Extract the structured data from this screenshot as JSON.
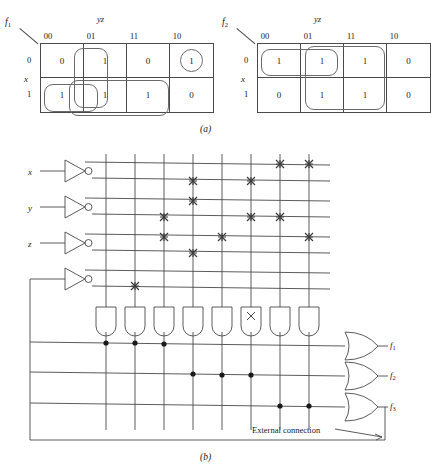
{
  "figure": {
    "part_a_label": "(a)",
    "part_b_label": "(b)"
  },
  "kmaps": [
    {
      "name": "f1",
      "name_base": "f",
      "name_sub": "1",
      "col_var": "yz",
      "row_var": "x",
      "col_headers": [
        "00",
        "01",
        "11",
        "10"
      ],
      "row_headers": [
        "0",
        "1"
      ],
      "values": [
        [
          "0",
          "1",
          "0",
          "1"
        ],
        [
          "1",
          "1",
          "1",
          "0"
        ]
      ],
      "groups": [
        "column-01-pair",
        "row-1-cells-00-01-11",
        "cell-0-10-single"
      ]
    },
    {
      "name": "f2",
      "name_base": "f",
      "name_sub": "2",
      "col_var": "yz",
      "row_var": "x",
      "col_headers": [
        "00",
        "01",
        "11",
        "10"
      ],
      "row_headers": [
        "0",
        "1"
      ],
      "values": [
        [
          "1",
          "1",
          "1",
          "0"
        ],
        [
          "0",
          "1",
          "1",
          "0"
        ]
      ],
      "groups": [
        "row-0-cells-00-01",
        "columns-01-11-both-rows"
      ]
    }
  ],
  "pla": {
    "inputs": [
      "x",
      "y",
      "z"
    ],
    "feedback_input": "f3-feedback",
    "outputs": [
      {
        "label_base": "f",
        "label_sub": "1"
      },
      {
        "label_base": "f",
        "label_sub": "2"
      },
      {
        "label_base": "f",
        "label_sub": "3"
      }
    ],
    "and_gate_count": 8,
    "input_line_count": 8,
    "and_plane_crosspoints": [
      {
        "row": 2,
        "col": 4
      },
      {
        "row": 3,
        "col": 4
      },
      {
        "row": 4,
        "col": 3
      },
      {
        "row": 5,
        "col": 3
      },
      {
        "row": 5,
        "col": 5
      },
      {
        "row": 6,
        "col": 4
      },
      {
        "row": 8,
        "col": 2
      },
      {
        "row": 1,
        "col": 7
      },
      {
        "row": 1,
        "col": 8
      },
      {
        "row": 2,
        "col": 6
      },
      {
        "row": 4,
        "col": 6
      },
      {
        "row": 4,
        "col": 7
      },
      {
        "row": 5,
        "col": 8
      }
    ],
    "or_plane_dots": [
      {
        "out": 1,
        "col": 1
      },
      {
        "out": 1,
        "col": 2
      },
      {
        "out": 1,
        "col": 3
      },
      {
        "out": 2,
        "col": 4
      },
      {
        "out": 2,
        "col": 5
      },
      {
        "out": 2,
        "col": 6
      },
      {
        "out": 3,
        "col": 7
      },
      {
        "out": 3,
        "col": 8
      }
    ],
    "unused_and_gate_mark": "×",
    "unused_and_gate_index": 6,
    "external_connection_label": "External connection"
  }
}
